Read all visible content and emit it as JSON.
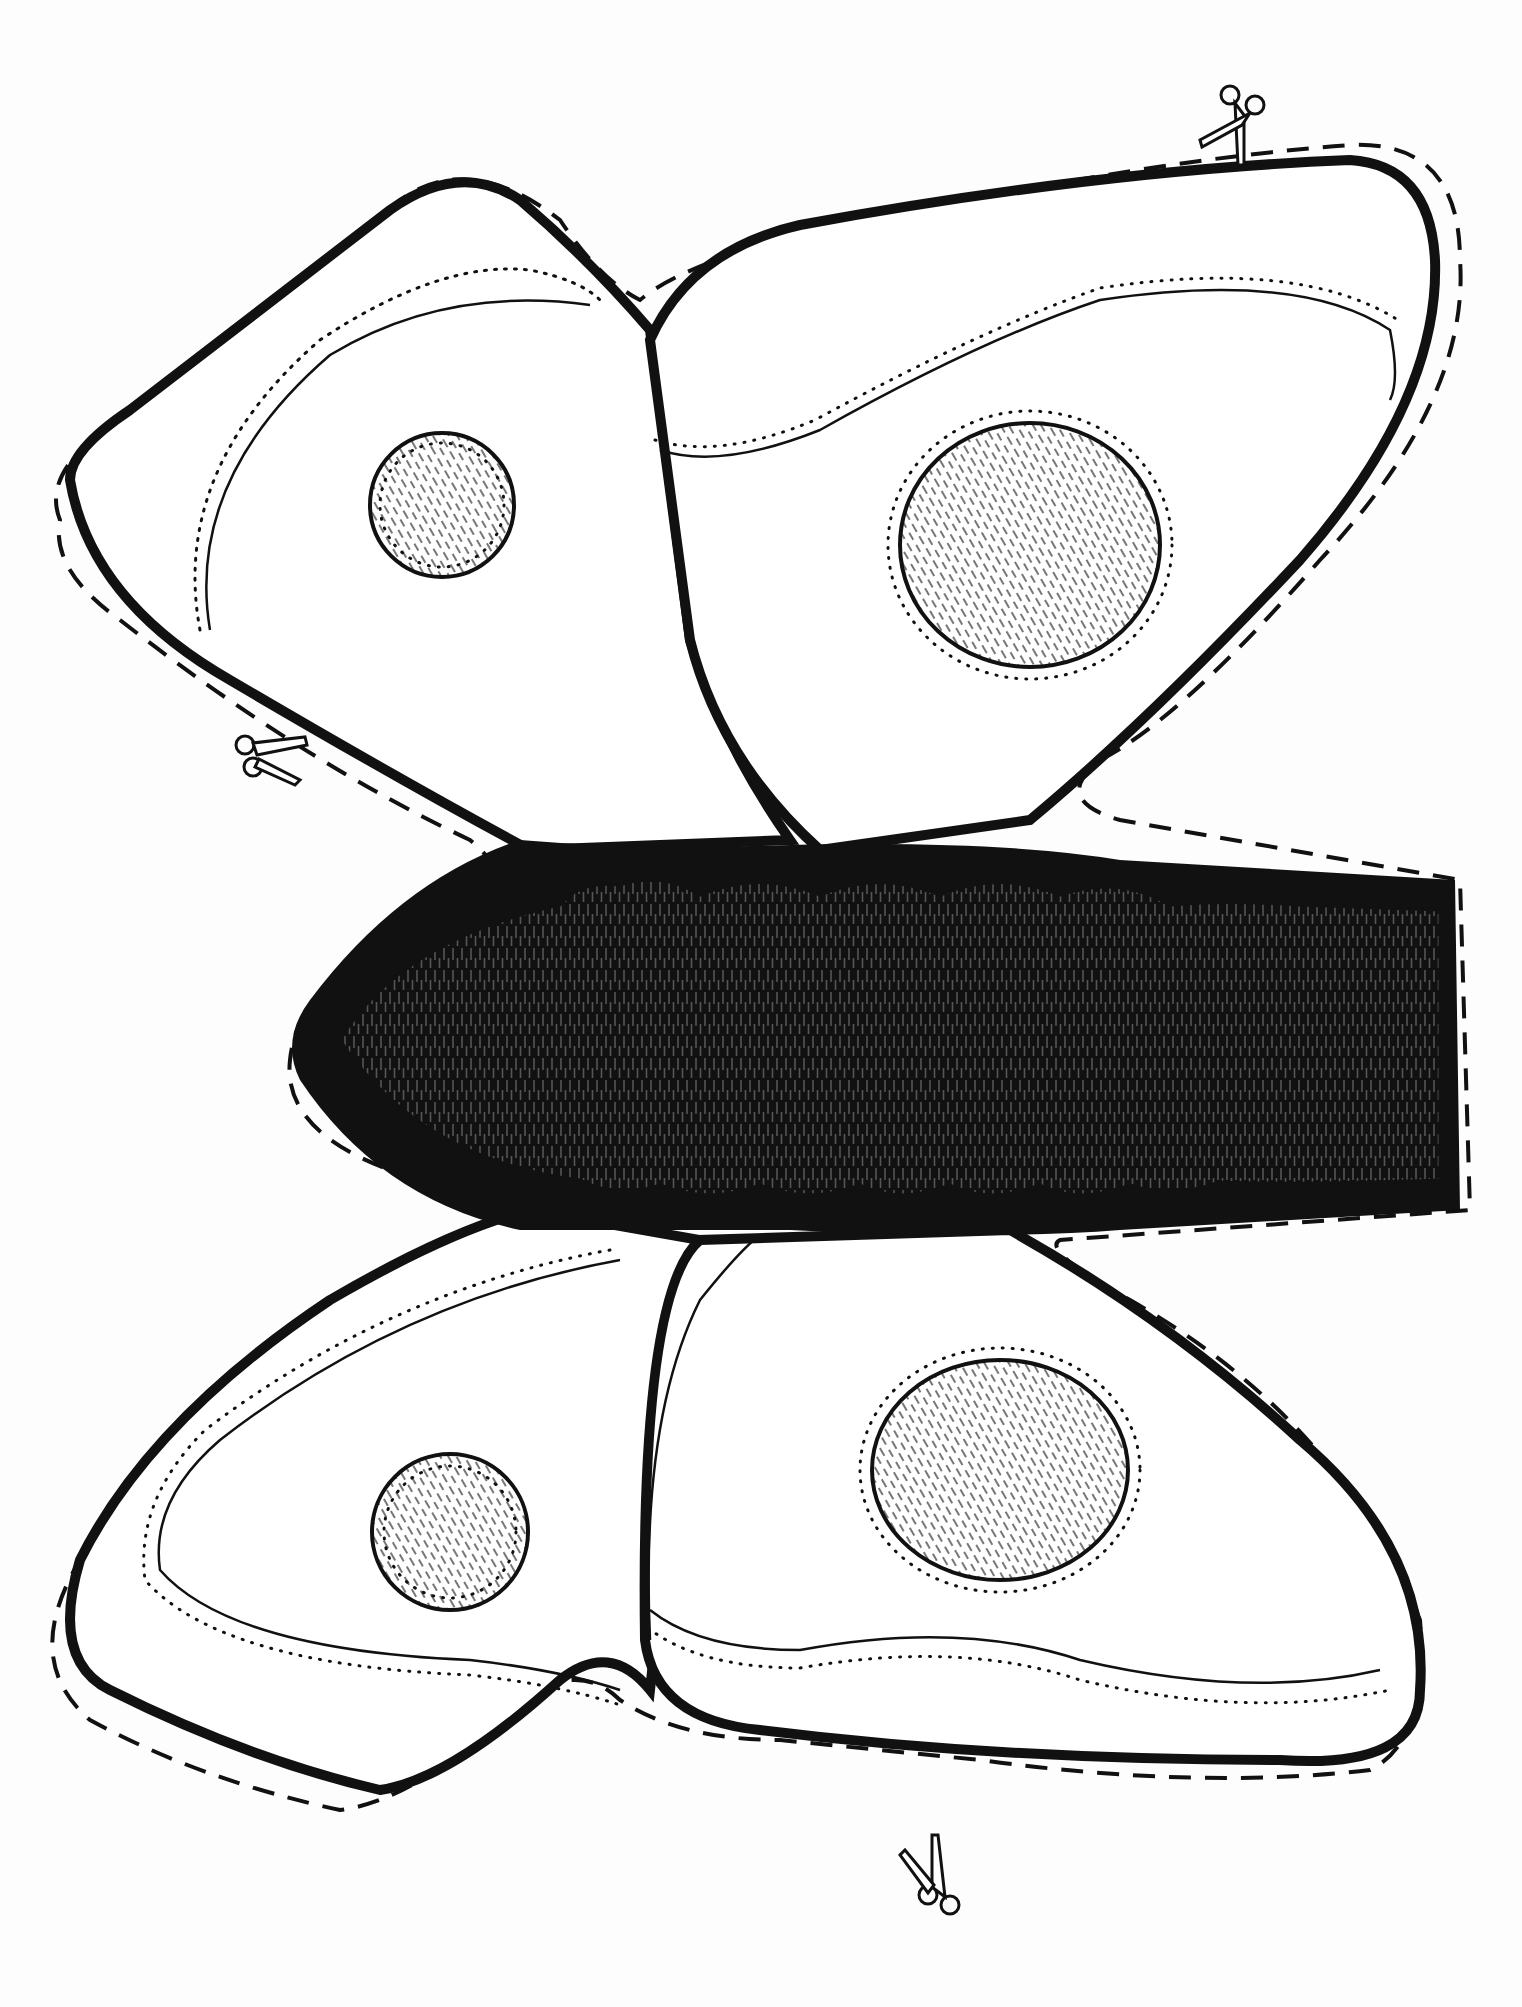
{
  "page": {
    "background_color": "#fdfdfd",
    "ink_color": "#111111",
    "hatch_color": "#555555"
  },
  "parts": {
    "upper_left_wing": {
      "spots": 1
    },
    "upper_right_wing": {
      "spots": 1
    },
    "lower_left_wing": {
      "spots": 1
    },
    "lower_right_wing": {
      "spots": 1
    },
    "body": {
      "segments": 6
    }
  },
  "icons": [
    {
      "name": "scissors-icon",
      "position": "top-right"
    },
    {
      "name": "scissors-icon",
      "position": "left"
    },
    {
      "name": "scissors-icon",
      "position": "bottom-center"
    }
  ],
  "lines": {
    "cut_line": "dashed",
    "fold_line": "dotted"
  }
}
